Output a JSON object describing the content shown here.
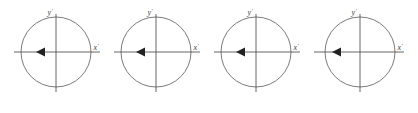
{
  "figure": {
    "type": "diagram",
    "background_color": "#ffffff",
    "stroke_color": "#6b6b6b",
    "axis_color": "#555555",
    "label_color": "#3a3a3a",
    "arrow_color": "#222222",
    "panel_count": 4
  },
  "panels": [
    {
      "index": 1,
      "center_x": 56,
      "center_y": 52,
      "radius": 35,
      "y_axis_label": "y",
      "y_axis_prime": "′",
      "x_axis_label": "x",
      "x_axis_prime": "′",
      "arrow_direction": "left",
      "arrow_symbol": "◄"
    },
    {
      "index": 2,
      "center_x": 156,
      "center_y": 52,
      "radius": 35,
      "y_axis_label": "y",
      "y_axis_prime": "′",
      "x_axis_label": "x",
      "x_axis_prime": "′",
      "arrow_direction": "left",
      "arrow_symbol": "◄"
    },
    {
      "index": 3,
      "center_x": 256,
      "center_y": 52,
      "radius": 35,
      "y_axis_label": "y",
      "y_axis_prime": "′",
      "x_axis_label": "x",
      "x_axis_prime": "′",
      "arrow_direction": "left",
      "arrow_symbol": "◄"
    },
    {
      "index": 4,
      "center_x": 360,
      "center_y": 52,
      "radius": 35,
      "y_axis_label": "y",
      "y_axis_prime": "′",
      "x_axis_label": "x",
      "x_axis_prime": "′",
      "arrow_direction": "left",
      "arrow_symbol": "◄"
    }
  ]
}
